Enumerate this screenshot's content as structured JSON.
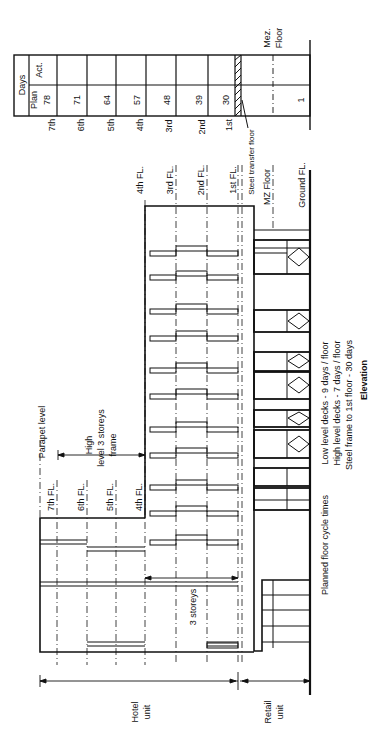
{
  "title": "Elevation",
  "table": {
    "header": "Days",
    "row_act": "Act.",
    "row_plan": "Plan",
    "columns": [
      {
        "floor": "7th",
        "plan": "78",
        "act": ""
      },
      {
        "floor": "6th",
        "plan": "71",
        "act": ""
      },
      {
        "floor": "5th",
        "plan": "64",
        "act": ""
      },
      {
        "floor": "4th",
        "plan": "57",
        "act": ""
      },
      {
        "floor": "3rd",
        "plan": "48",
        "act": ""
      },
      {
        "floor": "2nd",
        "plan": "39",
        "act": ""
      },
      {
        "floor": "1st",
        "plan": "30",
        "act": ""
      },
      {
        "floor": "",
        "plan": "1",
        "act": ""
      }
    ],
    "mez_label_1": "Mez.",
    "mez_label_2": "Floor",
    "steel_transfer": "Steel transfer floor"
  },
  "levels": {
    "fl4_low": "4th FL.",
    "fl3": "3rd FL.",
    "fl2": "2nd FL.",
    "fl1": "1st FL.",
    "mz": "MZ Floor",
    "ground": "Ground FL.",
    "fl7": "7th FL.",
    "fl6": "6th FL.",
    "fl5": "5th FL.",
    "fl4_high": "4th FL.",
    "parapet": "Parapet level"
  },
  "annotations": {
    "high_level_1": "High",
    "high_level_2": "level  3 storeys",
    "high_level_3": "frame",
    "three_storeys": "3 storeys",
    "hotel_1": "Hotel",
    "hotel_2": "unit",
    "retail_1": "Retail",
    "retail_2": "unit",
    "planned": "Planned floor cycle times",
    "cycle_1": "Low level decks - 9 days / floor",
    "cycle_2": "High level decks - 7 days / floor",
    "cycle_3": "Steel frame to 1st floor - 30 days",
    "caption": "Elevation"
  }
}
